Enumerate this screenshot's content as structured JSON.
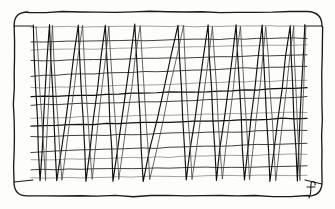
{
  "artwork": {
    "title": "Zigzag Weave",
    "medium": "pen-and-ink line drawing",
    "signature": "f",
    "background_color": "#fdfdfb",
    "ink_color": "#111111",
    "frame_color": "#1a1a1a"
  },
  "frame": {
    "shape": "rounded-rectangle",
    "left": 14,
    "top": 12,
    "right": 322,
    "bottom": 196,
    "corner_radius": 14,
    "stroke_width": 1.35
  },
  "inner_field": {
    "left": 31,
    "top": 25,
    "right": 307,
    "bottom": 181,
    "corner_connectors": [
      {
        "name": "top-left",
        "x1": 14,
        "y1": 26,
        "x2": 33,
        "y2": 26
      },
      {
        "name": "top-right",
        "x1": 322,
        "y1": 26,
        "x2": 305,
        "y2": 26
      },
      {
        "name": "bottom-left",
        "x1": 14,
        "y1": 182,
        "x2": 33,
        "y2": 180
      },
      {
        "name": "bottom-right",
        "x1": 322,
        "y1": 184,
        "x2": 305,
        "y2": 180
      }
    ]
  },
  "chart_data": {
    "type": "line",
    "title": "Zigzag Weave",
    "xlabel": "",
    "ylabel": "",
    "grid": true,
    "legend": "none",
    "xlim": [
      31,
      307
    ],
    "ylim": [
      25,
      181
    ],
    "series": [
      {
        "name": "zigzag-primary",
        "description": "steep near-vertical zigzag traversing full height, peaks at top, valleys at bottom",
        "x": [
          33,
          40,
          49,
          57,
          78,
          86,
          105,
          113,
          135,
          143,
          178,
          186,
          208,
          216,
          236,
          244,
          262,
          270,
          290,
          297,
          305
        ],
        "y": [
          25,
          181,
          25,
          181,
          25,
          181,
          25,
          181,
          25,
          181,
          25,
          181,
          25,
          181,
          25,
          181,
          25,
          181,
          25,
          181,
          25
        ]
      },
      {
        "name": "zigzag-secondary",
        "description": "offset companion zigzag drawn slightly askew, creating narrow wedge pairs",
        "x": [
          36,
          45,
          52,
          62,
          82,
          92,
          109,
          119,
          140,
          150,
          183,
          192,
          213,
          222,
          240,
          250,
          266,
          276,
          293,
          300,
          306
        ],
        "y": [
          26,
          180,
          26,
          180,
          26,
          180,
          26,
          180,
          26,
          180,
          26,
          180,
          26,
          180,
          26,
          180,
          26,
          180,
          26,
          180,
          26
        ]
      }
    ],
    "horizontal_rules": [
      {
        "y_left": 27,
        "y_right": 26,
        "weight": "faint"
      },
      {
        "y_left": 42,
        "y_right": 38,
        "weight": "normal"
      },
      {
        "y_left": 50,
        "y_right": 45,
        "weight": "faint"
      },
      {
        "y_left": 61,
        "y_right": 55,
        "weight": "normal"
      },
      {
        "y_left": 76,
        "y_right": 66,
        "weight": "normal"
      },
      {
        "y_left": 88,
        "y_right": 80,
        "weight": "faint"
      },
      {
        "y_left": 97,
        "y_right": 88,
        "weight": "heavy"
      },
      {
        "y_left": 105,
        "y_right": 97,
        "weight": "normal"
      },
      {
        "y_left": 118,
        "y_right": 112,
        "weight": "faint"
      },
      {
        "y_left": 126,
        "y_right": 118,
        "weight": "heavy"
      },
      {
        "y_left": 137,
        "y_right": 130,
        "weight": "normal"
      },
      {
        "y_left": 152,
        "y_right": 143,
        "weight": "normal"
      },
      {
        "y_left": 160,
        "y_right": 154,
        "weight": "faint"
      },
      {
        "y_left": 170,
        "y_right": 166,
        "weight": "normal"
      },
      {
        "y_left": 178,
        "y_right": 175,
        "weight": "faint"
      }
    ],
    "peak_count_top": 11,
    "valley_count_bottom": 11,
    "horizontal_rule_count": 15
  },
  "signature_mark": {
    "glyph": "f",
    "x": 312,
    "y": 196,
    "style": "cursive"
  }
}
